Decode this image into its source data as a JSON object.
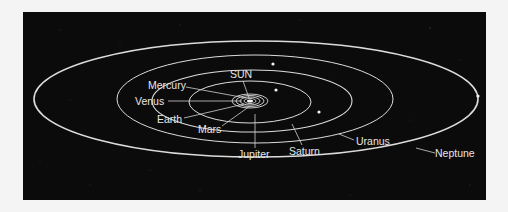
{
  "diagram": {
    "background_color": "#0b0b0b",
    "page_color": "#f4f4f4",
    "line_color": "#dcdcdc",
    "center_label": "SUN",
    "labels": {
      "sun": "SUN",
      "mercury": "Mercury",
      "venus": "Venus",
      "earth": "Earth",
      "mars": "Mars",
      "jupiter": "Jupiter",
      "saturn": "Saturn",
      "uranus": "Uranus",
      "neptune": "Neptune"
    },
    "orbit_order": [
      "Mercury",
      "Venus",
      "Earth",
      "Mars",
      "Jupiter",
      "Saturn",
      "Uranus",
      "Neptune"
    ]
  }
}
